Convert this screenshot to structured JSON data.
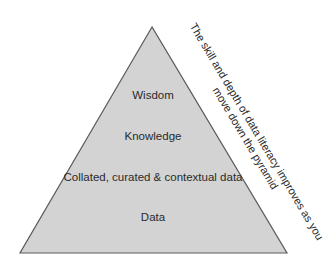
{
  "diagram": {
    "type": "pyramid",
    "fill_color": "#d3d3d3",
    "stroke_color": "#5a5a5a",
    "levels": [
      {
        "label": "Wisdom"
      },
      {
        "label": "Knowledge"
      },
      {
        "label": "Collated, curated & contextual data"
      },
      {
        "label": "Data"
      }
    ],
    "side_note": {
      "line1": "The skill and depth of data literacy improves as you",
      "line2": "move down the pyramid"
    }
  }
}
